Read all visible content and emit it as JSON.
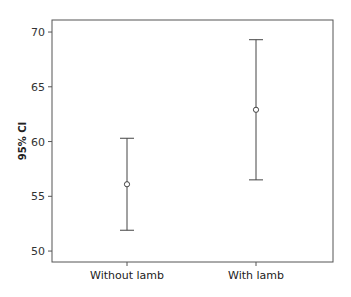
{
  "chart_data": {
    "type": "errorbar",
    "title": "",
    "xlabel": "",
    "ylabel": "95% CI",
    "categories": [
      "Without lamb",
      "With lamb"
    ],
    "series": [
      {
        "name": "95% CI",
        "means": [
          56.1,
          62.9
        ],
        "lower": [
          51.9,
          56.5
        ],
        "upper": [
          60.3,
          69.3
        ]
      }
    ],
    "ylim": [
      49,
      71.1
    ],
    "yticks": [
      50,
      55,
      60,
      65,
      70
    ],
    "grid": false,
    "legend": "none",
    "marker": "open-circle",
    "colors": {
      "line": "#444444",
      "axis": "#555555",
      "background": "#ffffff"
    }
  },
  "axis": {
    "ylabel": "95% CI",
    "yticks": [
      "50",
      "55",
      "60",
      "65",
      "70"
    ],
    "xticks": [
      "Without lamb",
      "With lamb"
    ]
  }
}
